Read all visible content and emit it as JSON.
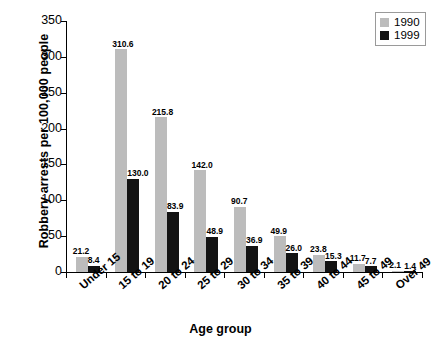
{
  "chart_data": {
    "type": "bar",
    "title": "",
    "xlabel": "Age group",
    "ylabel": "Robbery arrests per 100,000 people",
    "ylim": [
      0,
      350
    ],
    "yticks": [
      0,
      50,
      100,
      150,
      200,
      250,
      300,
      350
    ],
    "grid": false,
    "legend_position": "top-right",
    "categories": [
      "Under 15",
      "15 to 19",
      "20 to 24",
      "25 to 29",
      "30 to 34",
      "35 to 39",
      "40 to 44",
      "45 to 49",
      "Over 49"
    ],
    "series": [
      {
        "name": "1990",
        "color": "#bcbcbc",
        "values": [
          21.2,
          310.6,
          215.8,
          142.0,
          90.7,
          49.9,
          23.8,
          11.7,
          2.1
        ],
        "labels": [
          "21.2",
          "310.6",
          "215.8",
          "142.0",
          "90.7",
          "49.9",
          "23.8",
          "11.7",
          "2.1"
        ]
      },
      {
        "name": "1999",
        "color": "#131313",
        "values": [
          8.4,
          130.0,
          83.9,
          48.9,
          36.9,
          26.0,
          15.3,
          7.7,
          1.4
        ],
        "labels": [
          "8.4",
          "130.0",
          "83.9",
          "48.9",
          "36.9",
          "26.0",
          "15.3",
          "7.7",
          "1.4"
        ]
      }
    ]
  },
  "legend": {
    "entries": [
      {
        "label": "1990",
        "color": "#bcbcbc"
      },
      {
        "label": "1999",
        "color": "#131313"
      }
    ]
  }
}
